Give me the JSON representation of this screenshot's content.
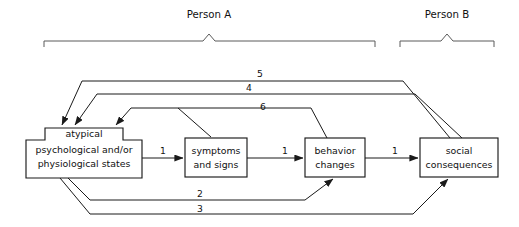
{
  "figure": {
    "type": "flow-diagram",
    "background_color": "#ffffff",
    "line_color": "#1a1a1a",
    "bracket_color": "#5a5a5a",
    "width": 519,
    "height": 227
  },
  "groups": [
    {
      "id": "person-a",
      "label": "Person A",
      "label_x": 209,
      "label_y": 14,
      "bracket_x1": 44,
      "bracket_x2": 375,
      "bracket_y": 41,
      "tip_x": 209
    },
    {
      "id": "person-b",
      "label": "Person B",
      "label_x": 447,
      "label_y": 14,
      "bracket_x1": 400,
      "bracket_x2": 494,
      "bracket_y": 41,
      "tip_x": 447
    }
  ],
  "nodes": [
    {
      "id": "atypical-states",
      "shape": "stepped",
      "lines": [
        "atypical",
        "psychological and/or",
        "physiological states"
      ],
      "x": 26,
      "y": 128,
      "width": 116,
      "height": 50,
      "notch_x": 45,
      "notch_width": 78,
      "notch_height": 12
    },
    {
      "id": "symptoms-signs",
      "shape": "rect",
      "lines": [
        "symptoms",
        "and signs"
      ],
      "x": 185,
      "y": 138,
      "width": 62,
      "height": 39
    },
    {
      "id": "behavior-changes",
      "shape": "rect",
      "lines": [
        "behavior",
        "changes"
      ],
      "x": 305,
      "y": 138,
      "width": 60,
      "height": 39
    },
    {
      "id": "social-consequences",
      "shape": "rect",
      "lines": [
        "social",
        "consequences"
      ],
      "x": 420,
      "y": 138,
      "width": 78,
      "height": 39
    }
  ],
  "edges": [
    {
      "id": "edge-1a",
      "label": "1",
      "label_x": 163,
      "label_y": 152,
      "from": "atypical-states",
      "to": "symptoms-signs"
    },
    {
      "id": "edge-1b",
      "label": "1",
      "label_x": 285,
      "label_y": 152,
      "from": "symptoms-signs",
      "to": "behavior-changes"
    },
    {
      "id": "edge-1c",
      "label": "1",
      "label_x": 395,
      "label_y": 152,
      "from": "behavior-changes",
      "to": "social-consequences"
    },
    {
      "id": "edge-2",
      "label": "2",
      "label_x": 200,
      "label_y": 196,
      "from": "atypical-states",
      "to": "behavior-changes"
    },
    {
      "id": "edge-3",
      "label": "3",
      "label_x": 200,
      "label_y": 211,
      "from": "atypical-states",
      "to": "social-consequences"
    },
    {
      "id": "edge-4",
      "label": "4",
      "label_x": 249,
      "label_y": 90,
      "from": "social-consequences",
      "to": "atypical-states"
    },
    {
      "id": "edge-5",
      "label": "5",
      "label_x": 260,
      "label_y": 74,
      "from": "social-consequences",
      "to": "atypical-states"
    },
    {
      "id": "edge-6",
      "label": "6",
      "label_x": 263,
      "label_y": 106,
      "from": "behavior-changes",
      "to": "atypical-states"
    }
  ]
}
